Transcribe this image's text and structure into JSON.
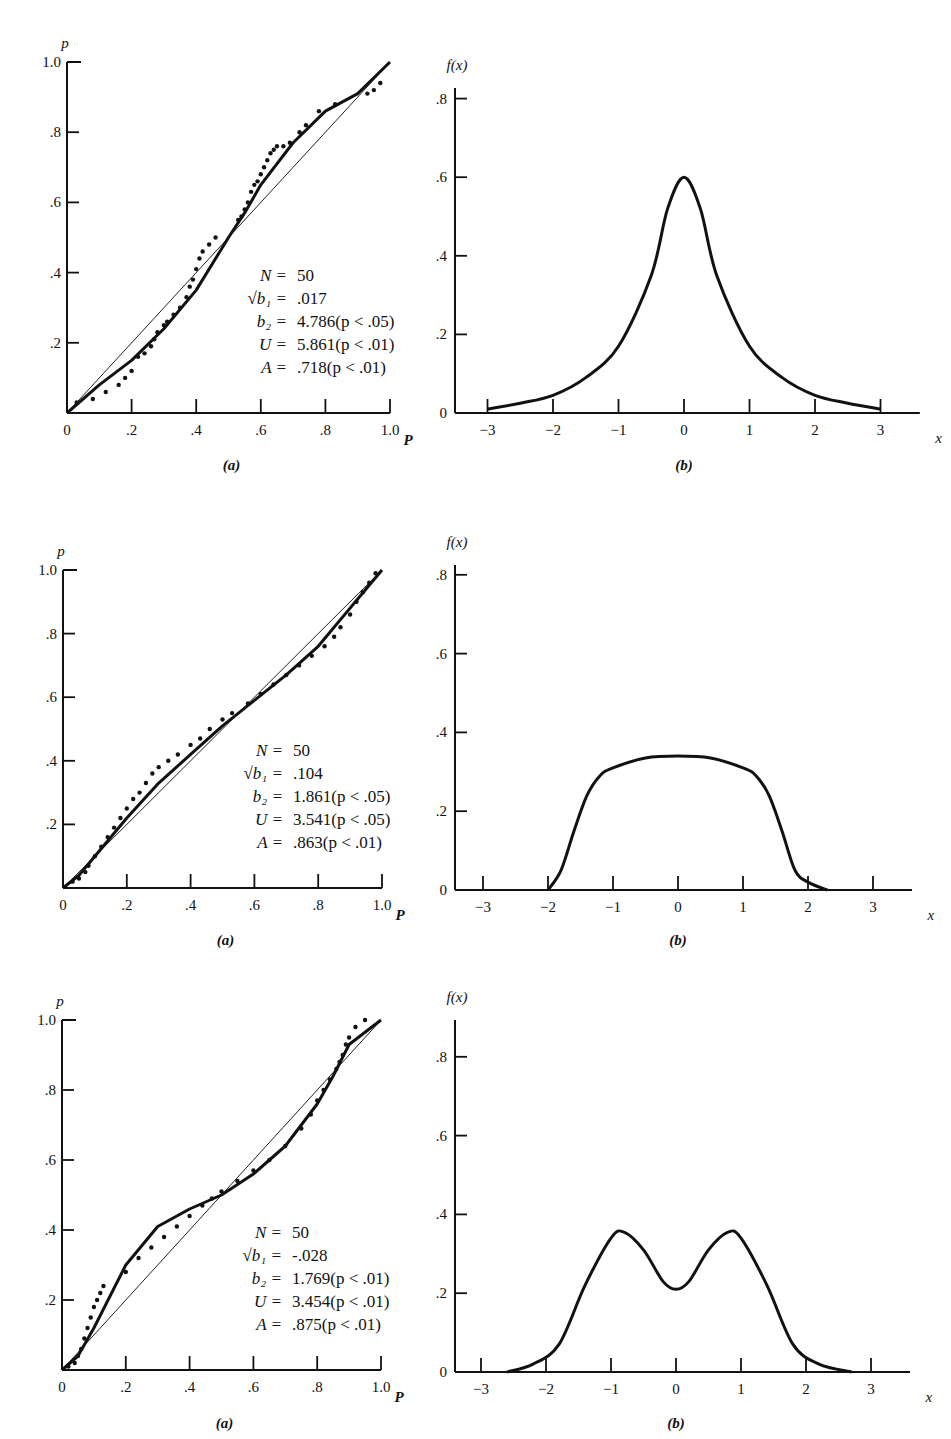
{
  "chart_data": [
    {
      "type": "scatter",
      "panel": "row1-a",
      "title": "",
      "xlabel": "P",
      "ylabel": "p",
      "xlim": [
        0,
        1.0
      ],
      "ylim": [
        0,
        1.0
      ],
      "xticks": [
        "0",
        ".2",
        ".4",
        ".6",
        ".8",
        "1.0"
      ],
      "yticks": [
        ".2",
        ".4",
        ".6",
        ".8",
        "1.0"
      ],
      "caption": "(a)",
      "series": [
        {
          "name": "reference line (p = P)",
          "style": "thin line",
          "x": [
            0,
            1
          ],
          "y": [
            0,
            1
          ]
        },
        {
          "name": "theoretical curve",
          "style": "thick line",
          "x": [
            0,
            0.1,
            0.2,
            0.3,
            0.4,
            0.5,
            0.55,
            0.6,
            0.7,
            0.8,
            0.9,
            1.0
          ],
          "y": [
            0,
            0.08,
            0.15,
            0.24,
            0.35,
            0.5,
            0.57,
            0.65,
            0.77,
            0.86,
            0.91,
            1.0
          ]
        },
        {
          "name": "sample points",
          "style": "dots",
          "x": [
            0.03,
            0.08,
            0.12,
            0.16,
            0.18,
            0.2,
            0.22,
            0.24,
            0.26,
            0.27,
            0.28,
            0.3,
            0.31,
            0.33,
            0.35,
            0.37,
            0.38,
            0.39,
            0.4,
            0.41,
            0.42,
            0.44,
            0.46,
            0.53,
            0.54,
            0.55,
            0.56,
            0.57,
            0.58,
            0.59,
            0.6,
            0.61,
            0.62,
            0.63,
            0.64,
            0.65,
            0.67,
            0.69,
            0.72,
            0.74,
            0.78,
            0.83,
            0.93,
            0.95,
            0.97
          ],
          "y": [
            0.03,
            0.04,
            0.06,
            0.08,
            0.1,
            0.12,
            0.16,
            0.17,
            0.19,
            0.21,
            0.23,
            0.25,
            0.26,
            0.28,
            0.3,
            0.33,
            0.36,
            0.38,
            0.41,
            0.44,
            0.46,
            0.48,
            0.5,
            0.55,
            0.56,
            0.58,
            0.6,
            0.63,
            0.65,
            0.66,
            0.68,
            0.7,
            0.72,
            0.74,
            0.75,
            0.76,
            0.76,
            0.77,
            0.8,
            0.82,
            0.86,
            0.88,
            0.91,
            0.92,
            0.94
          ]
        }
      ],
      "stats": {
        "N": "50",
        "sqrt_b1": ".017",
        "b2": "4.786(p < .05)",
        "U": "5.861(p < .01)",
        "A": ".718(p < .01)"
      }
    },
    {
      "type": "line",
      "panel": "row1-b",
      "xlabel": "x",
      "ylabel": "f(x)",
      "xlim": [
        -3.5,
        3.5
      ],
      "ylim": [
        0,
        1.0
      ],
      "xticks": [
        "-3",
        "-2",
        "-1",
        "0",
        "1",
        "2",
        "3"
      ],
      "yticks": [
        "0",
        ".2",
        ".4",
        ".6",
        ".8"
      ],
      "caption": "(b)",
      "series": [
        {
          "name": "f(x)",
          "x": [
            -3,
            -2.5,
            -2,
            -1.5,
            -1,
            -0.5,
            -0.25,
            0,
            0.25,
            0.5,
            1,
            1.5,
            2,
            2.5,
            3
          ],
          "y": [
            0.01,
            0.025,
            0.045,
            0.09,
            0.17,
            0.35,
            0.52,
            0.6,
            0.52,
            0.35,
            0.17,
            0.09,
            0.045,
            0.025,
            0.01
          ]
        }
      ]
    },
    {
      "type": "scatter",
      "panel": "row2-a",
      "xlabel": "P",
      "ylabel": "p",
      "xlim": [
        0,
        1.0
      ],
      "ylim": [
        0,
        1.0
      ],
      "xticks": [
        "0",
        ".2",
        ".4",
        ".6",
        ".8",
        "1.0"
      ],
      "yticks": [
        ".2",
        ".4",
        ".6",
        ".8",
        "1.0"
      ],
      "caption": "(a)",
      "series": [
        {
          "name": "reference line (p = P)",
          "style": "thin line",
          "x": [
            0,
            1
          ],
          "y": [
            0,
            1
          ]
        },
        {
          "name": "theoretical curve",
          "style": "thick line",
          "x": [
            0,
            0.05,
            0.1,
            0.2,
            0.3,
            0.4,
            0.5,
            0.6,
            0.7,
            0.8,
            0.9,
            0.95,
            1.0
          ],
          "y": [
            0,
            0.04,
            0.1,
            0.22,
            0.33,
            0.42,
            0.51,
            0.59,
            0.67,
            0.76,
            0.88,
            0.94,
            1.0
          ]
        },
        {
          "name": "sample points",
          "style": "dots",
          "x": [
            0.03,
            0.05,
            0.07,
            0.08,
            0.1,
            0.12,
            0.14,
            0.16,
            0.18,
            0.2,
            0.22,
            0.24,
            0.26,
            0.28,
            0.3,
            0.33,
            0.36,
            0.4,
            0.43,
            0.46,
            0.5,
            0.53,
            0.58,
            0.62,
            0.66,
            0.7,
            0.74,
            0.78,
            0.82,
            0.85,
            0.87,
            0.9,
            0.92,
            0.94,
            0.96,
            0.98
          ],
          "y": [
            0.02,
            0.03,
            0.05,
            0.07,
            0.1,
            0.13,
            0.16,
            0.19,
            0.22,
            0.25,
            0.28,
            0.3,
            0.33,
            0.36,
            0.38,
            0.4,
            0.42,
            0.45,
            0.47,
            0.5,
            0.53,
            0.55,
            0.58,
            0.61,
            0.64,
            0.67,
            0.7,
            0.73,
            0.76,
            0.79,
            0.82,
            0.86,
            0.9,
            0.93,
            0.96,
            0.99
          ]
        }
      ],
      "stats": {
        "N": "50",
        "sqrt_b1": ".104",
        "b2": "1.861(p < .05)",
        "U": "3.541(p < .05)",
        "A": ".863(p < .01)"
      }
    },
    {
      "type": "line",
      "panel": "row2-b",
      "xlabel": "x",
      "ylabel": "f(x)",
      "xlim": [
        -3.5,
        3.5
      ],
      "ylim": [
        0,
        1.0
      ],
      "xticks": [
        "-3",
        "-2",
        "-1",
        "0",
        "1",
        "2",
        "3"
      ],
      "yticks": [
        "0",
        ".2",
        ".4",
        ".6",
        ".8"
      ],
      "caption": "(b)",
      "series": [
        {
          "name": "f(x)",
          "x": [
            -2.0,
            -1.8,
            -1.6,
            -1.4,
            -1.2,
            -1,
            -0.5,
            0,
            0.5,
            1,
            1.2,
            1.4,
            1.6,
            1.8,
            2.0,
            2.3
          ],
          "y": [
            0.0,
            0.05,
            0.15,
            0.24,
            0.29,
            0.31,
            0.335,
            0.34,
            0.335,
            0.31,
            0.29,
            0.24,
            0.15,
            0.05,
            0.02,
            0.0
          ]
        }
      ]
    },
    {
      "type": "scatter",
      "panel": "row3-a",
      "xlabel": "P",
      "ylabel": "p",
      "xlim": [
        0,
        1.0
      ],
      "ylim": [
        0,
        1.0
      ],
      "xticks": [
        "0",
        ".2",
        ".4",
        ".6",
        ".8",
        "1.0"
      ],
      "yticks": [
        ".2",
        ".4",
        ".6",
        ".8",
        "1.0"
      ],
      "caption": "(a)",
      "series": [
        {
          "name": "reference line (p = P)",
          "style": "thin line",
          "x": [
            0,
            1
          ],
          "y": [
            0,
            1
          ]
        },
        {
          "name": "theoretical curve",
          "style": "thick line",
          "x": [
            0,
            0.05,
            0.1,
            0.2,
            0.3,
            0.4,
            0.5,
            0.6,
            0.7,
            0.8,
            0.85,
            0.9,
            1.0
          ],
          "y": [
            0,
            0.04,
            0.12,
            0.3,
            0.41,
            0.46,
            0.5,
            0.56,
            0.64,
            0.76,
            0.84,
            0.93,
            1.0
          ]
        },
        {
          "name": "sample points",
          "style": "dots",
          "x": [
            0.02,
            0.04,
            0.05,
            0.06,
            0.07,
            0.08,
            0.09,
            0.1,
            0.11,
            0.12,
            0.13,
            0.2,
            0.24,
            0.28,
            0.32,
            0.36,
            0.4,
            0.44,
            0.47,
            0.5,
            0.55,
            0.6,
            0.65,
            0.7,
            0.75,
            0.78,
            0.8,
            0.82,
            0.84,
            0.86,
            0.87,
            0.88,
            0.89,
            0.9,
            0.92,
            0.95
          ],
          "y": [
            0.01,
            0.02,
            0.04,
            0.06,
            0.09,
            0.12,
            0.15,
            0.18,
            0.2,
            0.22,
            0.24,
            0.28,
            0.32,
            0.35,
            0.38,
            0.41,
            0.44,
            0.47,
            0.49,
            0.51,
            0.54,
            0.57,
            0.6,
            0.64,
            0.69,
            0.73,
            0.77,
            0.8,
            0.83,
            0.86,
            0.88,
            0.9,
            0.93,
            0.95,
            0.98,
            1.0
          ]
        }
      ],
      "stats": {
        "N": "50",
        "sqrt_b1": "-.028",
        "b2": "1.769(p < .01)",
        "U": "3.454(p < .01)",
        "A": ".875(p < .01)"
      }
    },
    {
      "type": "line",
      "panel": "row3-b",
      "xlabel": "x",
      "ylabel": "f(x)",
      "xlim": [
        -3.5,
        3.5
      ],
      "ylim": [
        0,
        1.0
      ],
      "xticks": [
        "-3",
        "-2",
        "-1",
        "0",
        "1",
        "2",
        "3"
      ],
      "yticks": [
        "0",
        ".2",
        ".4",
        ".6",
        ".8"
      ],
      "caption": "(b)",
      "series": [
        {
          "name": "f(x)",
          "x": [
            -2.6,
            -2.2,
            -1.8,
            -1.4,
            -1.0,
            -0.8,
            -0.5,
            -0.2,
            0,
            0.2,
            0.5,
            0.8,
            1.0,
            1.4,
            1.8,
            2.2,
            2.7
          ],
          "y": [
            0.0,
            0.02,
            0.07,
            0.22,
            0.34,
            0.355,
            0.31,
            0.23,
            0.21,
            0.23,
            0.31,
            0.355,
            0.34,
            0.22,
            0.07,
            0.02,
            0.0
          ]
        }
      ]
    }
  ],
  "labels": {
    "pp_ylabel": "p",
    "pp_xlabel": "P",
    "pp_origin": "0",
    "pdf_ylabel": "f(x)",
    "pdf_xlabel": "x",
    "caption_a": "(a)",
    "caption_b": "(b)",
    "stat_N": "N =",
    "stat_b1": "√b₁ =",
    "stat_b2": "b₂ =",
    "stat_U": "U =",
    "stat_A": "A ="
  }
}
